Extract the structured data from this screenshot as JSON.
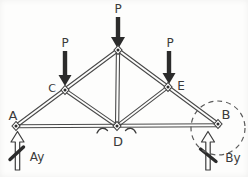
{
  "diagram": {
    "kind": "hand-drawn truss free-body diagram",
    "paper_color": "#fdfdfc",
    "ink_color": "#3d3d3d",
    "load_arrow_color": "#2b2b2b",
    "highlight": "dashed circle around joint B"
  },
  "labels": {
    "joint_a": "A",
    "joint_b": "B",
    "joint_c": "C",
    "joint_d": "D",
    "joint_e": "E",
    "load_apex": "P",
    "load_c": "P",
    "load_e": "P",
    "reaction_a": "Ay",
    "reaction_b": "By"
  },
  "structure": {
    "joints": [
      "A",
      "C",
      "apex",
      "E",
      "B",
      "D"
    ],
    "members": [
      "A-C",
      "C-apex",
      "apex-E",
      "E-B",
      "A-D",
      "D-B",
      "C-D",
      "apex-D",
      "E-D"
    ],
    "loads": [
      {
        "label": "P",
        "at": "apex",
        "direction": "down"
      },
      {
        "label": "P",
        "at": "C",
        "direction": "down"
      },
      {
        "label": "P",
        "at": "E",
        "direction": "down"
      }
    ],
    "reactions": [
      {
        "label": "Ay",
        "at": "A",
        "direction": "up"
      },
      {
        "label": "By",
        "at": "B",
        "direction": "up"
      }
    ]
  }
}
